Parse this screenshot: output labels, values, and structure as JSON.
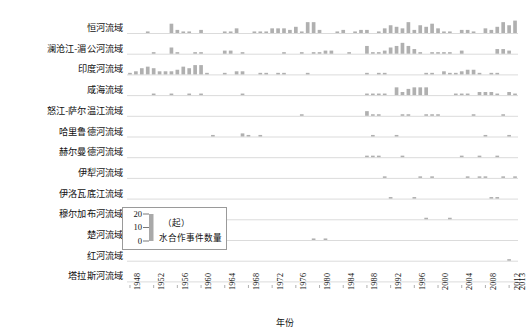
{
  "chart_data": {
    "type": "bar",
    "title": "",
    "xlabel": "年份",
    "ylabel": "（起）水合作事件数量",
    "legend_unit": "（起）",
    "legend_label": "水合作事件数量",
    "legend_ticks": [
      "20",
      "10",
      "0"
    ],
    "ylim": [
      0,
      20
    ],
    "grid": false,
    "legend_position": "inner-left-lower",
    "bar_color": "#b0b0b0",
    "baseline_color": "#d7d7d7",
    "x_start": 1948,
    "x_end": 2013,
    "x_tick_labels": [
      "1948",
      "1952",
      "1956",
      "1960",
      "1964",
      "1968",
      "1972",
      "1976",
      "1980",
      "1984",
      "1988",
      "1992",
      "1996",
      "2000",
      "2004",
      "2008",
      "2012",
      "2013"
    ],
    "categories": [
      1948,
      1949,
      1950,
      1951,
      1952,
      1953,
      1954,
      1955,
      1956,
      1957,
      1958,
      1959,
      1960,
      1961,
      1962,
      1963,
      1964,
      1965,
      1966,
      1967,
      1968,
      1969,
      1970,
      1971,
      1972,
      1973,
      1974,
      1975,
      1976,
      1977,
      1978,
      1979,
      1980,
      1981,
      1982,
      1983,
      1984,
      1985,
      1986,
      1987,
      1988,
      1989,
      1990,
      1991,
      1992,
      1993,
      1994,
      1995,
      1996,
      1997,
      1998,
      1999,
      2000,
      2001,
      2002,
      2003,
      2004,
      2005,
      2006,
      2007,
      2008,
      2009,
      2010,
      2011,
      2012,
      2013
    ],
    "series": [
      {
        "name": "恒河流域",
        "values": [
          0,
          0,
          0,
          1,
          0,
          0,
          0,
          6,
          2,
          1,
          1,
          0,
          2,
          0,
          0,
          0,
          1,
          1,
          3,
          0,
          0,
          1,
          1,
          1,
          3,
          3,
          3,
          2,
          4,
          1,
          7,
          7,
          2,
          0,
          0,
          1,
          2,
          0,
          1,
          2,
          2,
          0,
          1,
          3,
          5,
          4,
          3,
          7,
          2,
          5,
          4,
          6,
          3,
          1,
          1,
          0,
          2,
          2,
          1,
          0,
          3,
          2,
          4,
          7,
          5,
          8
        ]
      },
      {
        "name": "澜沧江-湄公河流域",
        "values": [
          0,
          0,
          0,
          0,
          1,
          0,
          0,
          4,
          1,
          0,
          0,
          1,
          1,
          0,
          0,
          0,
          2,
          2,
          0,
          1,
          0,
          0,
          0,
          0,
          0,
          0,
          1,
          0,
          0,
          1,
          0,
          1,
          1,
          2,
          2,
          0,
          0,
          1,
          0,
          0,
          5,
          1,
          1,
          2,
          4,
          5,
          7,
          5,
          3,
          1,
          0,
          1,
          1,
          1,
          1,
          0,
          2,
          0,
          0,
          0,
          0,
          0,
          3,
          3,
          2,
          0
        ]
      },
      {
        "name": "印度河流域",
        "values": [
          1,
          2,
          4,
          5,
          4,
          2,
          2,
          2,
          3,
          5,
          4,
          6,
          6,
          1,
          0,
          0,
          1,
          0,
          2,
          2,
          0,
          0,
          1,
          1,
          0,
          1,
          1,
          0,
          0,
          0,
          1,
          0,
          0,
          0,
          0,
          0,
          0,
          0,
          0,
          0,
          1,
          0,
          1,
          1,
          0,
          0,
          0,
          0,
          0,
          0,
          1,
          1,
          0,
          2,
          1,
          1,
          2,
          3,
          3,
          1,
          0,
          1,
          1,
          0,
          0,
          0
        ]
      },
      {
        "name": "咸海流域",
        "values": [
          0,
          0,
          0,
          0,
          1,
          0,
          0,
          1,
          0,
          0,
          1,
          0,
          1,
          0,
          0,
          0,
          0,
          0,
          0,
          1,
          0,
          0,
          0,
          0,
          0,
          0,
          0,
          0,
          0,
          0,
          0,
          0,
          0,
          0,
          0,
          0,
          0,
          0,
          0,
          0,
          1,
          1,
          1,
          1,
          0,
          5,
          2,
          4,
          5,
          5,
          5,
          0,
          0,
          0,
          0,
          1,
          1,
          1,
          0,
          2,
          2,
          2,
          1,
          0,
          2,
          1
        ]
      },
      {
        "name": "怒江-萨尔温江流域",
        "values": [
          0,
          0,
          0,
          0,
          0,
          0,
          0,
          0,
          0,
          0,
          0,
          0,
          0,
          0,
          0,
          0,
          0,
          0,
          0,
          0,
          0,
          0,
          0,
          0,
          0,
          0,
          0,
          0,
          0,
          1,
          0,
          0,
          0,
          0,
          0,
          0,
          0,
          0,
          0,
          0,
          3,
          1,
          1,
          0,
          0,
          0,
          1,
          1,
          0,
          0,
          1,
          1,
          1,
          0,
          0,
          0,
          0,
          0,
          1,
          0,
          0,
          0,
          0,
          1,
          0,
          0
        ]
      },
      {
        "name": "哈里鲁德河流域",
        "values": [
          0,
          0,
          0,
          0,
          0,
          0,
          0,
          0,
          0,
          0,
          0,
          0,
          0,
          0,
          1,
          0,
          0,
          0,
          0,
          2,
          1,
          0,
          1,
          0,
          0,
          0,
          0,
          0,
          0,
          0,
          0,
          0,
          0,
          0,
          0,
          0,
          0,
          0,
          0,
          0,
          0,
          1,
          0,
          0,
          0,
          1,
          0,
          0,
          0,
          0,
          0,
          0,
          0,
          0,
          0,
          0,
          0,
          0,
          0,
          0,
          1,
          0,
          0,
          0,
          1,
          0
        ]
      },
      {
        "name": "赫尔曼德河流域",
        "values": [
          0,
          0,
          0,
          0,
          0,
          0,
          0,
          0,
          0,
          0,
          0,
          0,
          0,
          0,
          0,
          0,
          0,
          0,
          0,
          0,
          0,
          0,
          0,
          0,
          0,
          0,
          0,
          0,
          0,
          0,
          0,
          0,
          0,
          0,
          0,
          0,
          0,
          0,
          0,
          0,
          1,
          1,
          1,
          0,
          0,
          0,
          1,
          0,
          0,
          0,
          0,
          0,
          0,
          0,
          0,
          0,
          1,
          0,
          0,
          1,
          0,
          0,
          1,
          0,
          0,
          0
        ]
      },
      {
        "name": "伊犁河流域",
        "values": [
          0,
          0,
          0,
          0,
          0,
          0,
          0,
          0,
          0,
          0,
          0,
          0,
          0,
          0,
          0,
          0,
          0,
          0,
          0,
          0,
          0,
          0,
          0,
          0,
          0,
          0,
          0,
          0,
          0,
          0,
          0,
          0,
          0,
          0,
          0,
          0,
          0,
          0,
          0,
          0,
          0,
          0,
          0,
          1,
          0,
          0,
          0,
          0,
          0,
          1,
          0,
          1,
          0,
          0,
          0,
          0,
          0,
          1,
          0,
          1,
          1,
          0,
          0,
          1,
          0,
          1
        ]
      },
      {
        "name": "伊洛瓦底江流域",
        "values": [
          0,
          0,
          0,
          0,
          0,
          0,
          0,
          0,
          0,
          0,
          0,
          0,
          0,
          0,
          0,
          0,
          0,
          0,
          0,
          0,
          0,
          0,
          0,
          0,
          0,
          0,
          0,
          0,
          0,
          0,
          0,
          0,
          0,
          0,
          0,
          0,
          0,
          0,
          0,
          0,
          0,
          0,
          0,
          0,
          1,
          0,
          0,
          0,
          1,
          0,
          0,
          0,
          0,
          0,
          0,
          0,
          0,
          0,
          0,
          0,
          0,
          1,
          1,
          0,
          0,
          0
        ]
      },
      {
        "name": "穆尔加布河流域",
        "values": [
          0,
          0,
          0,
          0,
          0,
          0,
          0,
          0,
          0,
          0,
          0,
          0,
          0,
          0,
          0,
          0,
          0,
          0,
          0,
          0,
          0,
          0,
          0,
          0,
          0,
          0,
          0,
          0,
          0,
          0,
          0,
          0,
          0,
          0,
          0,
          0,
          0,
          0,
          0,
          0,
          0,
          0,
          0,
          0,
          0,
          0,
          0,
          0,
          0,
          0,
          1,
          0,
          0,
          0,
          1,
          0,
          0,
          0,
          0,
          0,
          0,
          0,
          0,
          0,
          0,
          0
        ]
      },
      {
        "name": "楚河流域",
        "values": [
          0,
          0,
          0,
          0,
          0,
          0,
          0,
          0,
          0,
          0,
          0,
          0,
          0,
          0,
          0,
          0,
          0,
          0,
          0,
          0,
          0,
          0,
          0,
          0,
          0,
          0,
          0,
          0,
          0,
          0,
          0,
          1,
          0,
          1,
          0,
          0,
          0,
          0,
          0,
          0,
          0,
          0,
          0,
          0,
          0,
          0,
          0,
          0,
          0,
          0,
          0,
          0,
          0,
          0,
          0,
          0,
          0,
          0,
          0,
          0,
          0,
          0,
          0,
          0,
          0,
          0
        ]
      },
      {
        "name": "红河流域",
        "values": [
          0,
          0,
          0,
          0,
          0,
          0,
          0,
          0,
          0,
          0,
          0,
          0,
          0,
          0,
          0,
          0,
          0,
          0,
          0,
          0,
          0,
          0,
          0,
          0,
          0,
          0,
          0,
          0,
          0,
          0,
          0,
          0,
          0,
          0,
          0,
          0,
          0,
          0,
          0,
          0,
          0,
          0,
          0,
          0,
          0,
          0,
          0,
          0,
          0,
          0,
          0,
          0,
          0,
          0,
          0,
          0,
          0,
          0,
          0,
          0,
          0,
          0,
          0,
          0,
          1,
          0
        ]
      },
      {
        "name": "塔拉斯河流域",
        "values": [
          0,
          0,
          0,
          0,
          0,
          0,
          0,
          0,
          0,
          0,
          0,
          0,
          0,
          0,
          0,
          0,
          0,
          0,
          0,
          0,
          0,
          0,
          0,
          0,
          0,
          0,
          0,
          0,
          0,
          0,
          0,
          0,
          0,
          0,
          0,
          0,
          0,
          0,
          0,
          0,
          0,
          0,
          0,
          0,
          0,
          0,
          0,
          0,
          0,
          0,
          0,
          0,
          0,
          0,
          0,
          0,
          0,
          0,
          0,
          0,
          0,
          0,
          0,
          0,
          0,
          0
        ]
      }
    ]
  }
}
